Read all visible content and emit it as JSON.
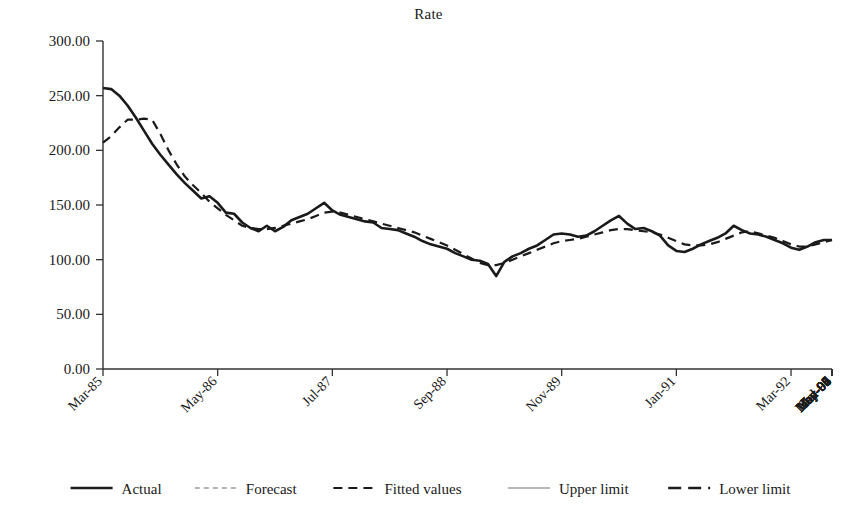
{
  "chart_data": {
    "type": "line",
    "title": "Rate",
    "xlabel": "",
    "ylabel": "",
    "ylim": [
      0,
      300
    ],
    "ytick_labels": [
      "0.00",
      "50.00",
      "100.00",
      "150.00",
      "200.00",
      "250.00",
      "300.00"
    ],
    "ytick_values": [
      0,
      50,
      100,
      150,
      200,
      250,
      300
    ],
    "grid": false,
    "legend_position": "bottom",
    "xtick_labels": [
      "Mar-85",
      "May-86",
      "Jul-87",
      "Sep-88",
      "Nov-89",
      "Jan-91",
      "Mar-92",
      "May-93",
      "Jul-94",
      "Sep-95",
      "Nov-96",
      "Jan-98",
      "Mar-99",
      "May-00",
      "Jul-01",
      "Sep-02",
      "Nov-03",
      "Jan-05",
      "Mar-06",
      "May-07"
    ],
    "xtick_step_months": 14,
    "x_first": "Mar-85",
    "x_last": "May-07",
    "n_points": 90,
    "legend": [
      {
        "name": "Actual",
        "style": "solid",
        "color": "#1a1a1a",
        "width": 2.6
      },
      {
        "name": "Forecast",
        "style": "dashed-short",
        "color": "#b3b3b3",
        "width": 2.2
      },
      {
        "name": "Fitted values",
        "style": "dashed",
        "color": "#1a1a1a",
        "width": 2.2
      },
      {
        "name": "Upper limit",
        "style": "solid",
        "color": "#b8b8b8",
        "width": 2.2
      },
      {
        "name": "Lower limit",
        "style": "dashed-long",
        "color": "#1a1a1a",
        "width": 2.6
      }
    ],
    "series": [
      {
        "name": "Actual",
        "style": "solid",
        "color": "#1a1a1a",
        "width": 2.6,
        "values": [
          257,
          256,
          250,
          241,
          230,
          218,
          206,
          196,
          187,
          178,
          170,
          163,
          156,
          158,
          152,
          143,
          142,
          134,
          129,
          126,
          131,
          126,
          130,
          136,
          139,
          142,
          147,
          152,
          145,
          141,
          139,
          137,
          135,
          134,
          129,
          128,
          127,
          124,
          121,
          117,
          114,
          112,
          110,
          106,
          103,
          100,
          99,
          96,
          85,
          98,
          103,
          106,
          110,
          113,
          118,
          123,
          124,
          123,
          121,
          122,
          126,
          131,
          136,
          140,
          133,
          128,
          129,
          126,
          122,
          113,
          108,
          107,
          110,
          114,
          117,
          120,
          124,
          131,
          127,
          124,
          123,
          121,
          118,
          115,
          111,
          109,
          112,
          116,
          118,
          118
        ]
      },
      {
        "name": "Fitted values",
        "style": "dashed",
        "color": "#1a1a1a",
        "width": 2.2,
        "values": [
          207,
          213,
          221,
          228,
          228,
          229,
          228,
          215,
          200,
          187,
          176,
          168,
          161,
          153,
          147,
          141,
          136,
          131,
          129,
          128,
          128,
          129,
          131,
          133,
          135,
          137,
          140,
          143,
          144,
          143,
          141,
          139,
          137,
          135,
          133,
          131,
          129,
          127,
          125,
          122,
          119,
          116,
          113,
          109,
          105,
          101,
          97,
          95,
          95,
          97,
          100,
          103,
          106,
          109,
          112,
          115,
          117,
          118,
          119,
          121,
          123,
          125,
          127,
          128,
          128,
          127,
          126,
          125,
          123,
          120,
          117,
          114,
          113,
          113,
          114,
          116,
          119,
          122,
          125,
          126,
          124,
          122,
          120,
          117,
          114,
          112,
          112,
          114,
          116,
          118
        ]
      }
    ]
  }
}
